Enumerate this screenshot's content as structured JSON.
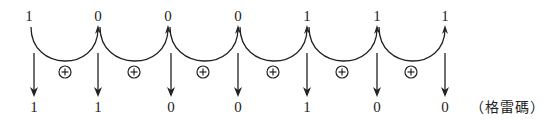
{
  "diagram": {
    "binary_bits": [
      "1",
      "0",
      "0",
      "0",
      "1",
      "1",
      "1"
    ],
    "gray_bits": [
      "1",
      "1",
      "0",
      "0",
      "1",
      "0",
      "0"
    ],
    "operator_symbol": "⊕",
    "operator_count": 6,
    "label": "（格雷碼）"
  }
}
